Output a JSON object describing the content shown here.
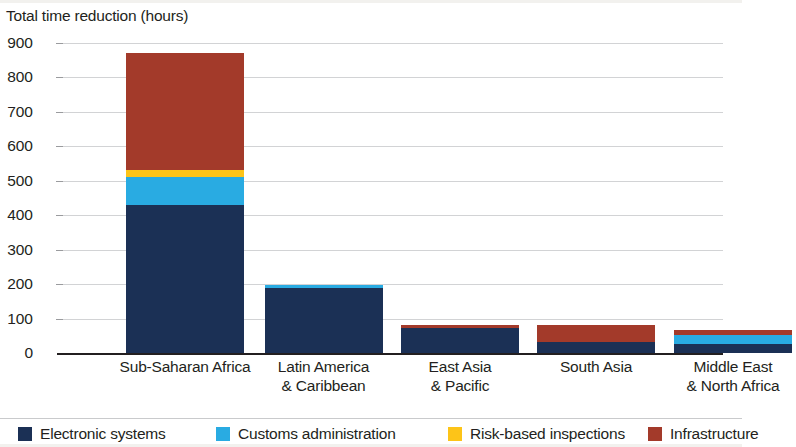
{
  "chart_data": {
    "type": "bar",
    "subtype": "stacked-vertical",
    "title": "Total time reduction (hours)",
    "xlabel": "",
    "ylabel": "Total time reduction (hours)",
    "ylim": [
      0,
      900
    ],
    "ytick_step": 100,
    "yticks": [
      "900",
      "800",
      "700",
      "600",
      "500",
      "400",
      "300",
      "200",
      "100",
      "0"
    ],
    "grid": true,
    "grid_axis": "y",
    "legend_position": "bottom",
    "categories": [
      "Sub-Saharan Africa",
      "Latin America & Caribbean",
      "East Asia & Pacific",
      "South Asia",
      "Middle East & North Africa"
    ],
    "category_lines": [
      [
        "Sub-Saharan Africa",
        ""
      ],
      [
        "Latin America",
        "& Caribbean"
      ],
      [
        "East Asia",
        "& Pacific"
      ],
      [
        "South Asia",
        ""
      ],
      [
        "Middle East",
        "& North Africa"
      ]
    ],
    "series": [
      {
        "name": "Electronic systems",
        "color": "#1b3055",
        "values": [
          430,
          188,
          72,
          33,
          25
        ]
      },
      {
        "name": "Customs administration",
        "color": "#29abe2",
        "values": [
          81,
          9,
          0,
          0,
          26
        ]
      },
      {
        "name": "Risk-based inspections",
        "color": "#fdc418",
        "values": [
          20,
          0,
          0,
          0,
          0
        ]
      },
      {
        "name": "Infrastructure",
        "color": "#a33a2a",
        "values": [
          339,
          0,
          8,
          47,
          15
        ]
      }
    ],
    "totals": [
      870,
      197,
      80,
      80,
      66
    ]
  },
  "axis": {
    "title": "Total time reduction (hours)"
  },
  "legend": {
    "items": [
      {
        "label": "Electronic systems",
        "color": "#1b3055"
      },
      {
        "label": "Customs administration",
        "color": "#29abe2"
      },
      {
        "label": "Risk-based inspections",
        "color": "#fdc418"
      },
      {
        "label": "Infrastructure",
        "color": "#a33a2a"
      }
    ]
  }
}
